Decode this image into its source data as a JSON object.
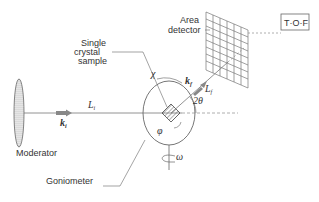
{
  "diagram": {
    "labels": {
      "moderator": "Moderator",
      "goniometer": "Goniometer",
      "sample_line1": "Single",
      "sample_line2": "crystal",
      "sample_line3": "sample",
      "detector_line1": "Area",
      "detector_line2": "detector",
      "tof": "T·O·F"
    },
    "symbols": {
      "k_incident": "k",
      "k_incident_sub": "i",
      "L_incident": "L",
      "L_incident_sub": "i",
      "k_final": "k",
      "k_final_sub": "f",
      "L_final": "L",
      "L_final_sub": "f",
      "two_theta": "2θ",
      "chi": "χ",
      "phi": "φ",
      "omega": "ω"
    },
    "colors": {
      "line": "#555555",
      "text": "#333333",
      "hatch": "#666666"
    }
  }
}
